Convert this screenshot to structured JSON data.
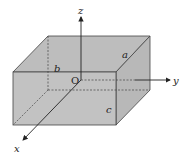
{
  "diagram": {
    "title": "",
    "fill_color": "#bdbdbd",
    "stroke_color": "#333333",
    "labels": {
      "z_axis": "z",
      "y_axis": "y",
      "x_axis": "x",
      "origin": "O",
      "edge_a": "a",
      "edge_b": "b",
      "edge_c": "c"
    }
  }
}
